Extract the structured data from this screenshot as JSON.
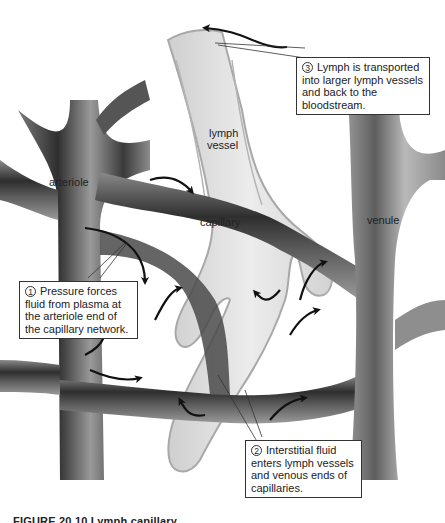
{
  "figure": {
    "caption": "FIGURE 20.10  Lymph capillary",
    "colors": {
      "background": "#ffffff",
      "blood_vessel_dark": "#3a3a3a",
      "blood_vessel_light": "#bdbdbd",
      "lymph_vessel_fill": "#dcdcdc",
      "lymph_vessel_edge": "#a8a8a8",
      "arrow": "#111111",
      "callout_border": "#333333"
    }
  },
  "labels": {
    "lymph_vessel_line1": "lymph",
    "lymph_vessel_line2": "vessel",
    "arteriole": "arteriole",
    "capillary": "capillary",
    "venule": "venule"
  },
  "callouts": [
    {
      "step": "1",
      "lines": [
        "Pressure forces",
        "fluid from plasma at",
        "the arteriole end of",
        "the capillary network."
      ]
    },
    {
      "step": "2",
      "lines": [
        "Interstitial fluid",
        "enters lymph vessels",
        "and venous ends of",
        "capillaries."
      ]
    },
    {
      "step": "3",
      "lines": [
        "Lymph is transported",
        "into larger lymph vessels",
        "and back to the",
        "bloodstream."
      ]
    }
  ],
  "icons": {
    "flow_arrow": "curved-arrow",
    "step_marker": "circled-number"
  }
}
